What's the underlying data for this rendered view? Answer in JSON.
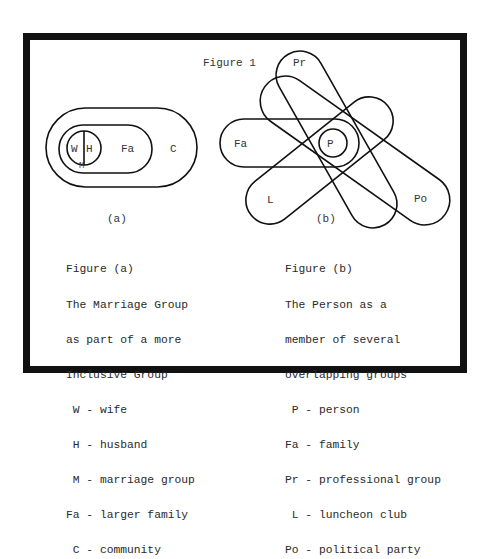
{
  "figure_title": "Figure 1",
  "figure_a": {
    "sublabel": "(a)",
    "regions": {
      "wife": "W",
      "husband": "H",
      "marriage": "M",
      "family": "Fa",
      "community": "C"
    },
    "caption": {
      "heading": "Figure (a)",
      "lines": [
        "The Marriage Group",
        "as part of a more",
        "Inclusive Group"
      ],
      "key": [
        " W - wife",
        " H - husband",
        " M - marriage group",
        "Fa - larger family",
        " C - community"
      ]
    }
  },
  "figure_b": {
    "sublabel": "(b)",
    "regions": {
      "person": "P",
      "family": "Fa",
      "professional": "Pr",
      "luncheon": "L",
      "political": "Po"
    },
    "caption": {
      "heading": "Figure (b)",
      "lines": [
        "The Person as a",
        "member of several",
        "overlapping groups"
      ],
      "key": [
        " P - person",
        "Fa - family",
        "Pr - professional group",
        " L - luncheon club",
        "Po - political party"
      ]
    }
  },
  "colors": {
    "ink": "#111111",
    "paper": "#ffffff"
  }
}
